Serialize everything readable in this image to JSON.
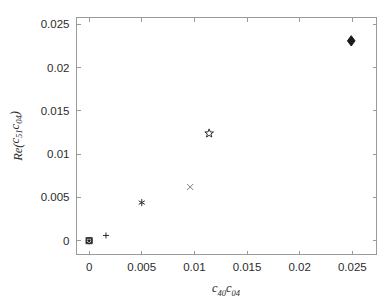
{
  "chart_data": {
    "type": "scatter",
    "title": "",
    "xlabel": "c_40 c_04",
    "ylabel": "Re(c_51 c_04)",
    "xlabel_parts": {
      "base1": "c",
      "sub1": "40",
      "base2": "c",
      "sub2": "04"
    },
    "ylabel_parts": {
      "prefix": "Re(",
      "base1": "c",
      "sub1": "51",
      "base2": "c",
      "sub2": "04",
      "suffix": ")"
    },
    "xlim": [
      -0.0012,
      0.0273
    ],
    "ylim": [
      -0.0016,
      0.0258
    ],
    "xticks": [
      0,
      0.005,
      0.01,
      0.015,
      0.02,
      0.025
    ],
    "yticks": [
      0,
      0.005,
      0.01,
      0.015,
      0.02,
      0.025
    ],
    "xticklabels": [
      "0",
      "0.005",
      "0.01",
      "0.015",
      "0.02",
      "0.025"
    ],
    "yticklabels": [
      "0",
      "0.005",
      "0.01",
      "0.015",
      "0.02",
      "0.025"
    ],
    "grid": false,
    "legend": false,
    "box": true,
    "axis_color": "#9a9a9a",
    "marker_color": "#2b2b2b",
    "background": "#ffffff",
    "points": [
      {
        "x": 0.0,
        "y": 0.0,
        "marker": "circle",
        "filled": false,
        "size": 6
      },
      {
        "x": 0.0,
        "y": 0.0,
        "marker": "square",
        "filled": false,
        "size": 6
      },
      {
        "x": 0.0,
        "y": 0.0,
        "marker": "hexagram",
        "filled": false,
        "size": 7
      },
      {
        "x": 0.0,
        "y": 0.0,
        "marker": "point",
        "filled": true,
        "size": 2
      },
      {
        "x": 0.0016,
        "y": 0.0006,
        "marker": "plus",
        "filled": false,
        "size": 6
      },
      {
        "x": 0.005,
        "y": 0.0044,
        "marker": "asterisk",
        "filled": false,
        "size": 7
      },
      {
        "x": 0.0096,
        "y": 0.0062,
        "marker": "cross",
        "filled": false,
        "size": 6
      },
      {
        "x": 0.0114,
        "y": 0.0124,
        "marker": "pentagram",
        "filled": false,
        "size": 9
      },
      {
        "x": 0.0249,
        "y": 0.0231,
        "marker": "diamond",
        "filled": true,
        "size": 9
      }
    ]
  },
  "figure": {
    "name": "scatter-plot-figure"
  }
}
